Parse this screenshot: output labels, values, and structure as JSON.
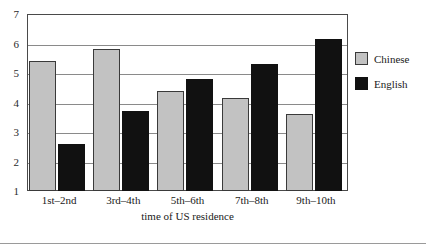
{
  "chart_data": {
    "type": "bar",
    "title": "",
    "subtitle": "",
    "xlabel": "time of US residence",
    "ylabel": "",
    "categories": [
      "1st–2nd",
      "3rd–4th",
      "5th–6th",
      "7th–8th",
      "9th–10th"
    ],
    "series": [
      {
        "name": "Chinese",
        "color": "#c2c2c2",
        "values": [
          5.4,
          5.8,
          4.4,
          4.15,
          3.6
        ]
      },
      {
        "name": "English",
        "color": "#111111",
        "values": [
          2.6,
          3.7,
          4.8,
          5.3,
          6.15
        ]
      }
    ],
    "ylim": [
      1,
      7
    ],
    "yticks": [
      1,
      2,
      3,
      4,
      5,
      6,
      7
    ],
    "ytick_labels": [
      "1",
      "2",
      "3",
      "4",
      "5",
      "6",
      "7"
    ],
    "grid": true,
    "grid_axis": "y",
    "legend_position": "right",
    "legend_entries": [
      "Chinese",
      "English"
    ]
  },
  "legend": {
    "items": [
      {
        "label": "Chinese",
        "swatch": "chinese"
      },
      {
        "label": "English",
        "swatch": "english"
      }
    ]
  },
  "axes": {
    "x_title": "time of US residence"
  }
}
